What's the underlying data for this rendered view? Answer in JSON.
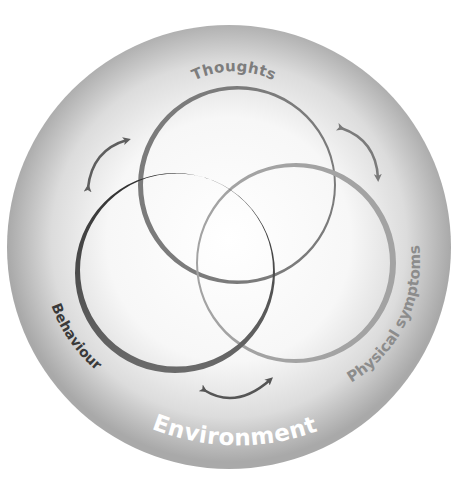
{
  "diagram": {
    "type": "venn-cycle",
    "title": "",
    "outer": {
      "label": "Environment",
      "center": [
        229,
        247
      ],
      "radius": 222,
      "fill_outer": "#a9a9a9",
      "fill_inner": "#ffffff",
      "label_color": "#ffffff"
    },
    "circles": [
      {
        "id": "thoughts",
        "label": "Thoughts",
        "center": [
          237,
          185
        ],
        "radius": 99,
        "stroke": "#7b7b7b",
        "thick_side": "left",
        "label_color": "#7d7d7d"
      },
      {
        "id": "behaviour",
        "label": "Behaviour",
        "center": [
          175,
          273
        ],
        "radius": 100,
        "stroke": "#3d3d3d",
        "thick_side": "bottom-left",
        "label_color": "#3a3a3a"
      },
      {
        "id": "physical",
        "label": "Physical symptoms",
        "center": [
          296,
          263
        ],
        "radius": 100,
        "stroke": "#a3a3a3",
        "thick_side": "right",
        "label_color": "#8c8c8c"
      }
    ],
    "arrows": [
      {
        "id": "behaviour-thoughts",
        "between": [
          "Behaviour",
          "Thoughts"
        ],
        "direction": "bidirectional",
        "color": "#5e5e5e"
      },
      {
        "id": "thoughts-physical",
        "between": [
          "Thoughts",
          "Physical symptoms"
        ],
        "direction": "bidirectional",
        "color": "#7a7a7a"
      },
      {
        "id": "behaviour-physical",
        "between": [
          "Behaviour",
          "Physical symptoms"
        ],
        "direction": "bidirectional",
        "color": "#555555"
      }
    ]
  }
}
